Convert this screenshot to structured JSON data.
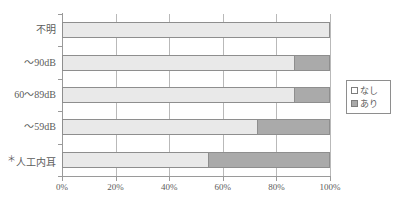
{
  "chart_data": {
    "type": "bar",
    "orientation": "horizontal",
    "stacked": true,
    "title": "",
    "subtitle": "",
    "xlabel": "",
    "ylabel": "",
    "categories": [
      "不明",
      "～90dB",
      "60～89dB",
      "～59dB",
      "＊人工内耳"
    ],
    "x_tick_labels": [
      "0%",
      "20%",
      "40%",
      "60%",
      "80%",
      "100%"
    ],
    "x_tick_values": [
      0,
      20,
      40,
      60,
      80,
      100
    ],
    "xlim": [
      0,
      100
    ],
    "grid": "vertical",
    "legend_position": "right",
    "series": [
      {
        "name": "なし",
        "color": "#e9e9e9",
        "values": [
          100,
          87,
          87,
          73,
          55
        ]
      },
      {
        "name": "あり",
        "color": "#aaaaaa",
        "values": [
          0,
          13,
          13,
          27,
          45
        ]
      }
    ]
  },
  "axis": {
    "ticks": [
      {
        "label": "0%",
        "value": 0
      },
      {
        "label": "20%",
        "value": 20
      },
      {
        "label": "40%",
        "value": 40
      },
      {
        "label": "60%",
        "value": 60
      },
      {
        "label": "80%",
        "value": 80
      },
      {
        "label": "100%",
        "value": 100
      }
    ]
  },
  "categories": [
    {
      "label": "不明",
      "star": "",
      "none": 100,
      "yes": 0
    },
    {
      "label": "～90dB",
      "star": "",
      "none": 87,
      "yes": 13
    },
    {
      "label": "60～89dB",
      "star": "",
      "none": 87,
      "yes": 13
    },
    {
      "label": "～59dB",
      "star": "",
      "none": 73,
      "yes": 27
    },
    {
      "label": "人工内耳",
      "star": "＊",
      "none": 55,
      "yes": 45
    }
  ],
  "legend": {
    "items": [
      {
        "label": "なし",
        "swatch": "none"
      },
      {
        "label": "あり",
        "swatch": "yes"
      }
    ]
  }
}
